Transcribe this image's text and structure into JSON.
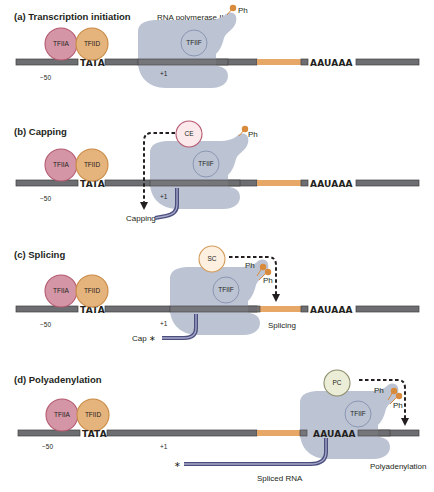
{
  "figure": {
    "panels": [
      {
        "id": "a",
        "title": "(a) Transcription initiation",
        "polymerase_label": "RNA polymerase II",
        "factors": [
          "TFIIA",
          "TFIID",
          "TFIIF"
        ],
        "phospho_labels": [
          "Ph"
        ],
        "positions": [
          "−50",
          "+1"
        ],
        "sequences": [
          "TATA",
          "AAUAAA"
        ]
      },
      {
        "id": "b",
        "title": "(b) Capping",
        "enzyme": "CE",
        "factors": [
          "TFIIA",
          "TFIID",
          "TFIIF"
        ],
        "phospho_labels": [
          "Ph"
        ],
        "positions": [
          "−50",
          "+1"
        ],
        "sequences": [
          "TATA",
          "AAUAAA"
        ],
        "process_label": "Capping"
      },
      {
        "id": "c",
        "title": "(c) Splicing",
        "enzyme": "SC",
        "factors": [
          "TFIIA",
          "TFIID",
          "TFIIF"
        ],
        "phospho_labels": [
          "Ph",
          "Ph"
        ],
        "positions": [
          "−50",
          "+1"
        ],
        "sequences": [
          "TATA",
          "AAUAAA"
        ],
        "cap_label": "Cap ∗",
        "process_label": "Splicing"
      },
      {
        "id": "d",
        "title": "(d) Polyadenylation",
        "enzyme": "PC",
        "factors": [
          "TFIIA",
          "TFIID",
          "TFIIF"
        ],
        "phospho_labels": [
          "Ph",
          "Ph"
        ],
        "positions": [
          "−50",
          "+1"
        ],
        "sequences": [
          "TATA",
          "AAUAAA"
        ],
        "rna_label": "Spliced RNA",
        "star": "∗",
        "process_label": "Polyadenylation"
      }
    ],
    "colors": {
      "dna": "#6d6e71",
      "exon": "#e7a867",
      "polymerase": "#bcc3d3",
      "tfiia": "#d496a6",
      "tfiid": "#e5b37c",
      "phosphate": "#d98a3a",
      "rna": "#4c4f7d"
    }
  }
}
